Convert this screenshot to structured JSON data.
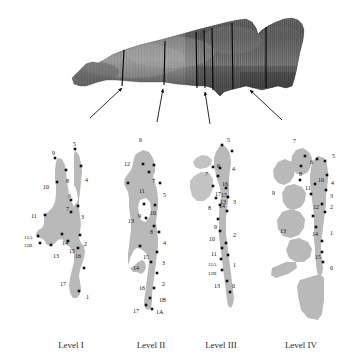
{
  "figure": {
    "specimen": {
      "name": "grayscale-specimen-photograph",
      "description": "Lateral grayscale photograph of a tapered striated specimen with vertical section lines",
      "section_line_count": 7
    },
    "arrows": {
      "count": 4,
      "description": "Arrows pointing from each level diagram up to its section plane on the specimen"
    },
    "colors": {
      "shape_fill": "#b9b9b9",
      "shape_fill_light": "#c9c9c9",
      "marker": "#111111",
      "label_text": "#111111",
      "caption_text": "#2b2b2b",
      "background": "#ffffff",
      "section_line": "#000000"
    },
    "levels": [
      {
        "id": "level-1",
        "caption": "Level I",
        "caption_x": 71,
        "caption_y": 340,
        "points": [
          {
            "label": "5",
            "lx": 73,
            "ly": 141,
            "mx": 75,
            "my": 149
          },
          {
            "label": "9",
            "lx": 52,
            "ly": 150,
            "mx": 55,
            "my": 158
          },
          {
            "label": "4",
            "lx": 85,
            "ly": 177,
            "mx": 81,
            "my": 166
          },
          {
            "label": "8",
            "lx": 66,
            "ly": 178,
            "mx": 66,
            "my": 170
          },
          {
            "label": "10",
            "lx": 43,
            "ly": 184,
            "mx": 57,
            "my": 182
          },
          {
            "label": "6",
            "lx": 68,
            "ly": 193,
            "mx": 71,
            "my": 200
          },
          {
            "label": "7",
            "lx": 66,
            "ly": 206,
            "mx": 71,
            "my": 212
          },
          {
            "label": "3",
            "lx": 81,
            "ly": 214,
            "mx": 78,
            "my": 206
          },
          {
            "label": "11",
            "lx": 31,
            "ly": 213,
            "mx": 45,
            "my": 215
          },
          {
            "label": "12A",
            "lx": 24,
            "ly": 235,
            "mx": 38,
            "my": 236
          },
          {
            "label": "12B",
            "lx": 24,
            "ly": 243,
            "mx": 40,
            "my": 243
          },
          {
            "label": "14",
            "lx": 62,
            "ly": 240,
            "mx": 62,
            "my": 234
          },
          {
            "label": "15",
            "lx": 69,
            "ly": 248,
            "mx": 68,
            "my": 241
          },
          {
            "label": "2",
            "lx": 84,
            "ly": 241,
            "mx": 80,
            "my": 235
          },
          {
            "label": "13",
            "lx": 53,
            "ly": 253,
            "mx": 51,
            "my": 245
          },
          {
            "label": "16",
            "lx": 75,
            "ly": 253,
            "mx": 78,
            "my": 248
          },
          {
            "label": "17",
            "lx": 60,
            "ly": 281,
            "mx": 84,
            "my": 268
          },
          {
            "label": "1",
            "lx": 86,
            "ly": 294,
            "mx": 79,
            "my": 291
          }
        ]
      },
      {
        "id": "level-2",
        "caption": "Level II",
        "caption_x": 151,
        "caption_y": 340,
        "points": [
          {
            "label": "6",
            "lx": 139,
            "ly": 137,
            "mx": 143,
            "my": 164
          },
          {
            "label": "12",
            "lx": 124,
            "ly": 161,
            "mx": 128,
            "my": 183
          },
          {
            "label": "7",
            "lx": 152,
            "ly": 178,
            "mx": 149,
            "my": 172
          },
          {
            "label": "11",
            "lx": 139,
            "ly": 188,
            "mx": 154,
            "my": 165
          },
          {
            "label": "5",
            "lx": 163,
            "ly": 192,
            "mx": 160,
            "my": 183
          },
          {
            "label": "9",
            "lx": 138,
            "ly": 213,
            "mx": 144,
            "my": 204
          },
          {
            "label": "10",
            "lx": 150,
            "ly": 210,
            "mx": 146,
            "my": 218
          },
          {
            "label": "13",
            "lx": 128,
            "ly": 218,
            "mx": 155,
            "my": 205
          },
          {
            "label": "8",
            "lx": 150,
            "ly": 229,
            "mx": 154,
            "my": 226
          },
          {
            "label": "4",
            "lx": 163,
            "ly": 240,
            "mx": 159,
            "my": 232
          },
          {
            "label": "15",
            "lx": 143,
            "ly": 254,
            "mx": 140,
            "my": 246
          },
          {
            "label": "3",
            "lx": 162,
            "ly": 260,
            "mx": 157,
            "my": 252
          },
          {
            "label": "14",
            "lx": 133,
            "ly": 265,
            "mx": 151,
            "my": 262
          },
          {
            "label": "2",
            "lx": 162,
            "ly": 281,
            "mx": 157,
            "my": 273
          },
          {
            "label": "16",
            "lx": 139,
            "ly": 285,
            "mx": 154,
            "my": 288
          },
          {
            "label": "1B",
            "lx": 159,
            "ly": 297,
            "mx": 150,
            "my": 298
          },
          {
            "label": "17",
            "lx": 133,
            "ly": 308,
            "mx": 146,
            "my": 305
          },
          {
            "label": "1A",
            "lx": 156,
            "ly": 309,
            "mx": 152,
            "my": 309
          }
        ]
      },
      {
        "id": "level-3",
        "caption": "Level III",
        "caption_x": 221,
        "caption_y": 340,
        "points": [
          {
            "label": "5",
            "lx": 227,
            "ly": 137,
            "mx": 222,
            "my": 145
          },
          {
            "label": "6",
            "lx": 217,
            "ly": 163,
            "mx": 232,
            "my": 151
          },
          {
            "label": "4",
            "lx": 232,
            "ly": 166,
            "mx": 220,
            "my": 168
          },
          {
            "label": "7",
            "lx": 205,
            "ly": 171,
            "mx": 213,
            "my": 167
          },
          {
            "label": "16",
            "lx": 222,
            "ly": 181,
            "mx": 218,
            "my": 176
          },
          {
            "label": "17",
            "lx": 215,
            "ly": 191,
            "mx": 213,
            "my": 186
          },
          {
            "label": "15",
            "lx": 221,
            "ly": 192,
            "mx": 226,
            "my": 188
          },
          {
            "label": "3",
            "lx": 233,
            "ly": 199,
            "mx": 228,
            "my": 197
          },
          {
            "label": "14",
            "lx": 219,
            "ly": 203,
            "mx": 216,
            "my": 198
          },
          {
            "label": "13",
            "lx": 220,
            "ly": 199,
            "mx": 220,
            "my": 205
          },
          {
            "label": "8",
            "lx": 208,
            "ly": 205,
            "mx": 227,
            "my": 211
          },
          {
            "label": "9",
            "lx": 214,
            "ly": 224,
            "mx": 218,
            "my": 219
          },
          {
            "label": "10",
            "lx": 209,
            "ly": 236,
            "mx": 220,
            "my": 231
          },
          {
            "label": "2",
            "lx": 233,
            "ly": 232,
            "mx": 226,
            "my": 243
          },
          {
            "label": "11",
            "lx": 211,
            "ly": 251,
            "mx": 222,
            "my": 248
          },
          {
            "label": "12A",
            "lx": 208,
            "ly": 262,
            "mx": 221,
            "my": 259
          },
          {
            "label": "1",
            "lx": 233,
            "ly": 262,
            "mx": 228,
            "my": 255
          },
          {
            "label": "12B",
            "lx": 208,
            "ly": 271,
            "mx": 222,
            "my": 270
          },
          {
            "label": "13",
            "lx": 214,
            "ly": 283,
            "mx": 227,
            "my": 281
          },
          {
            "label": "0",
            "lx": 232,
            "ly": 283,
            "mx": 230,
            "my": 292
          }
        ]
      },
      {
        "id": "level-4",
        "caption": "Level IV",
        "caption_x": 301,
        "caption_y": 340,
        "points": [
          {
            "label": "7",
            "lx": 293,
            "ly": 138,
            "mx": 305,
            "my": 156
          },
          {
            "label": "5",
            "lx": 332,
            "ly": 153,
            "mx": 325,
            "my": 161
          },
          {
            "label": "6",
            "lx": 310,
            "ly": 159,
            "mx": 317,
            "my": 159
          },
          {
            "label": "8",
            "lx": 299,
            "ly": 171,
            "mx": 301,
            "my": 166
          },
          {
            "label": "10",
            "lx": 318,
            "ly": 177,
            "mx": 315,
            "my": 184
          },
          {
            "label": "4",
            "lx": 331,
            "ly": 180,
            "mx": 327,
            "my": 175
          },
          {
            "label": "9",
            "lx": 272,
            "ly": 190,
            "mx": 300,
            "my": 180
          },
          {
            "label": "11",
            "lx": 305,
            "ly": 185,
            "mx": 311,
            "my": 194
          },
          {
            "label": "3",
            "lx": 330,
            "ly": 193,
            "mx": 326,
            "my": 190
          },
          {
            "label": "12",
            "lx": 313,
            "ly": 204,
            "mx": 322,
            "my": 204
          },
          {
            "label": "2",
            "lx": 330,
            "ly": 204,
            "mx": 325,
            "my": 212
          },
          {
            "label": "13",
            "lx": 280,
            "ly": 228,
            "mx": 313,
            "my": 216
          },
          {
            "label": "14",
            "lx": 312,
            "ly": 231,
            "mx": 316,
            "my": 227
          },
          {
            "label": "1",
            "lx": 330,
            "ly": 230,
            "mx": 322,
            "my": 241
          },
          {
            "label": "15",
            "lx": 315,
            "ly": 254,
            "mx": 322,
            "my": 252
          },
          {
            "label": "0",
            "lx": 330,
            "ly": 265,
            "mx": 323,
            "my": 262
          }
        ]
      }
    ]
  }
}
